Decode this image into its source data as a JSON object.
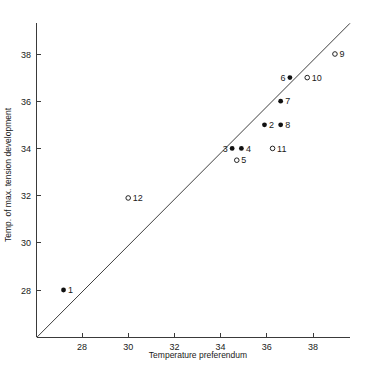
{
  "chart_data": {
    "type": "scatter",
    "title": "",
    "xlabel": "Temperature preferendum",
    "ylabel": "Temp. of max. tension development",
    "xlim": [
      26.05,
      39.6
    ],
    "ylim": [
      26.0,
      39.3
    ],
    "xticks": [
      28,
      30,
      32,
      34,
      36,
      38
    ],
    "yticks": [
      28,
      30,
      32,
      34,
      36,
      38
    ],
    "xtick_labels": [
      "28",
      "30",
      "32",
      "34",
      "36",
      "38"
    ],
    "ytick_labels": [
      "28",
      "30",
      "32",
      "34",
      "36",
      "38"
    ],
    "grid": false,
    "legend": "none",
    "annotations": [
      {
        "name": "identity-line",
        "type": "line",
        "description": "y = x reference line",
        "from": [
          26.05,
          26.0
        ],
        "to": [
          39.6,
          39.3
        ]
      }
    ],
    "series": [
      {
        "name": "filled",
        "marker": "filled-circle",
        "points": [
          {
            "label": "1",
            "x": 27.2,
            "y": 28.0,
            "label_side": "right"
          },
          {
            "label": "2",
            "x": 35.9,
            "y": 35.0,
            "label_side": "right"
          },
          {
            "label": "3",
            "x": 34.5,
            "y": 34.0,
            "label_side": "left"
          },
          {
            "label": "4",
            "x": 34.9,
            "y": 34.0,
            "label_side": "right"
          },
          {
            "label": "6",
            "x": 37.0,
            "y": 37.0,
            "label_side": "left"
          },
          {
            "label": "7",
            "x": 36.6,
            "y": 36.0,
            "label_side": "right"
          },
          {
            "label": "8",
            "x": 36.6,
            "y": 35.0,
            "label_side": "right"
          }
        ]
      },
      {
        "name": "open",
        "marker": "open-circle",
        "points": [
          {
            "label": "5",
            "x": 34.7,
            "y": 33.5,
            "label_side": "right"
          },
          {
            "label": "9",
            "x": 38.95,
            "y": 38.0,
            "label_side": "right"
          },
          {
            "label": "10",
            "x": 37.75,
            "y": 37.0,
            "label_side": "right"
          },
          {
            "label": "11",
            "x": 36.25,
            "y": 34.0,
            "label_side": "right"
          },
          {
            "label": "12",
            "x": 30.0,
            "y": 31.9,
            "label_side": "right"
          }
        ]
      }
    ],
    "colors": {
      "axis": "#3a3a3a",
      "line": "#3f3f3f",
      "marker_filled": "#111111",
      "marker_open_stroke": "#222222",
      "background": "#ffffff",
      "text": "#1a1a1a"
    }
  }
}
